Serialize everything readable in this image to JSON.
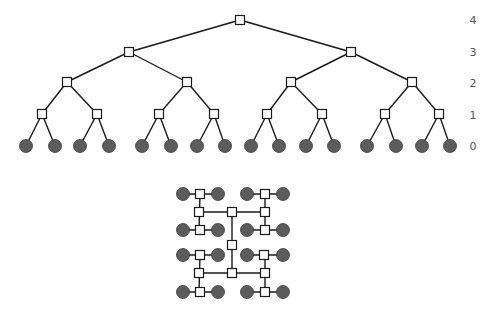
{
  "colors": {
    "edge": "#1a1a1a",
    "switch_fill": "#ffffff",
    "leaf_fill": "#5c5c5c",
    "label": "#555555"
  },
  "tree": {
    "level_labels": [
      {
        "text": "4",
        "y": 20
      },
      {
        "text": "3",
        "y": 52
      },
      {
        "text": "2",
        "y": 83
      },
      {
        "text": "1",
        "y": 115
      },
      {
        "text": "0",
        "y": 146
      }
    ],
    "label_x": 473,
    "levels": {
      "4": {
        "y": 20,
        "x": [
          240
        ]
      },
      "3": {
        "y": 52,
        "x": [
          129,
          351
        ]
      },
      "2": {
        "y": 82,
        "x": [
          67,
          187,
          291,
          412
        ]
      },
      "1": {
        "y": 114,
        "x": [
          42,
          97,
          159,
          214,
          267,
          322,
          385,
          439
        ]
      },
      "0": {
        "y": 146,
        "x": [
          26,
          55,
          80,
          109,
          142,
          171,
          197,
          225,
          251,
          279,
          306,
          334,
          367,
          396,
          422,
          450
        ]
      }
    }
  },
  "htree": {
    "switches": [
      [
        200,
        194
      ],
      [
        265,
        194
      ],
      [
        199,
        212
      ],
      [
        232,
        212
      ],
      [
        265,
        212
      ],
      [
        200,
        230
      ],
      [
        265,
        230
      ],
      [
        232,
        245
      ],
      [
        200,
        255
      ],
      [
        264,
        255
      ],
      [
        199,
        273
      ],
      [
        232,
        273
      ],
      [
        265,
        273
      ],
      [
        200,
        292
      ],
      [
        265,
        292
      ]
    ],
    "leaves": [
      [
        183,
        194
      ],
      [
        218,
        194
      ],
      [
        247,
        194
      ],
      [
        283,
        194
      ],
      [
        183,
        230
      ],
      [
        218,
        230
      ],
      [
        247,
        230
      ],
      [
        283,
        230
      ],
      [
        183,
        255
      ],
      [
        218,
        255
      ],
      [
        247,
        255
      ],
      [
        283,
        255
      ],
      [
        183,
        292
      ],
      [
        218,
        292
      ],
      [
        247,
        292
      ],
      [
        283,
        292
      ]
    ],
    "edges": [
      [
        183,
        194,
        218,
        194
      ],
      [
        247,
        194,
        283,
        194
      ],
      [
        183,
        230,
        218,
        230
      ],
      [
        247,
        230,
        283,
        230
      ],
      [
        183,
        255,
        218,
        255
      ],
      [
        247,
        255,
        283,
        255
      ],
      [
        183,
        292,
        218,
        292
      ],
      [
        247,
        292,
        283,
        292
      ],
      [
        200,
        194,
        199,
        230
      ],
      [
        265,
        194,
        265,
        230
      ],
      [
        199,
        212,
        265,
        212
      ],
      [
        200,
        255,
        199,
        292
      ],
      [
        265,
        255,
        265,
        292
      ],
      [
        199,
        273,
        265,
        273
      ],
      [
        232,
        212,
        232,
        273
      ]
    ]
  }
}
